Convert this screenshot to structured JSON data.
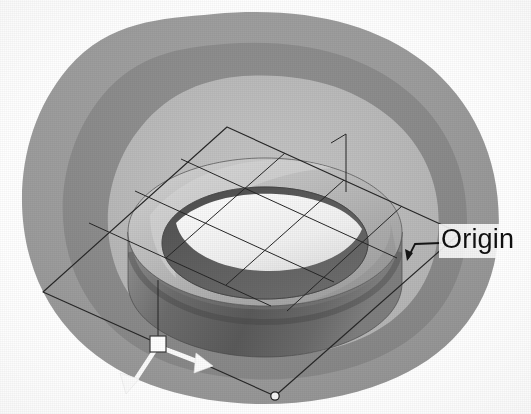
{
  "view": {
    "kind": "cad-3d-viewport",
    "background_color": "#ffffff",
    "width": 531,
    "height": 414
  },
  "annotations": {
    "origin_label": "Origin"
  },
  "icons": {
    "origin_marker": "origin-square-handle",
    "x_axis": "axis-arrow-x",
    "y_axis": "axis-arrow-y",
    "vertex_handle": "sketch-vertex-circle",
    "leader": "leader-line"
  },
  "geometry": {
    "model_name": "annular-ring-solid",
    "sketch_plane": "parallelogram-grid",
    "grid_divisions": 3,
    "origin_point": {
      "x": 158,
      "y": 344
    },
    "leader_anchor": {
      "x": 415,
      "y": 246
    },
    "grid_corners": [
      {
        "x": 227,
        "y": 127
      },
      {
        "x": 460,
        "y": 233
      },
      {
        "x": 275,
        "y": 396
      },
      {
        "x": 43,
        "y": 292
      }
    ]
  },
  "palette": {
    "paper": "#ffffff",
    "shadow_outer": "#9d9d9d",
    "shadow_mid": "#8d8d8d",
    "shadow_inner_light": "#bdbdbd",
    "ring_top": "#b4b4b4",
    "ring_top_light": "#c9c9c9",
    "ring_side": "#6f6f6f",
    "ring_side_dark": "#5c5c5c",
    "bore_wall": "#5a5a5a",
    "bore_floor": "#f4f4f4",
    "wire_stroke": "#2b2b2b",
    "marker_fill": "#ffffff",
    "label_color": "#101010"
  }
}
